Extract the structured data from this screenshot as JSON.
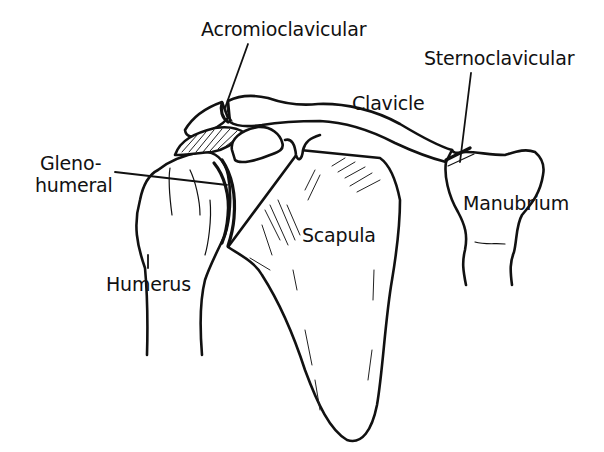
{
  "diagram": {
    "labels": {
      "acromioclavicular": "Acromioclavicular",
      "sternoclavicular": "Sternoclavicular",
      "clavicle": "Clavicle",
      "glenohumeral_line1": "Gleno-",
      "glenohumeral_line2": "humeral",
      "manubrium": "Manubrium",
      "scapula": "Scapula",
      "humerus": "Humerus"
    },
    "colors": {
      "ink": "#111111",
      "background": "#ffffff"
    }
  }
}
